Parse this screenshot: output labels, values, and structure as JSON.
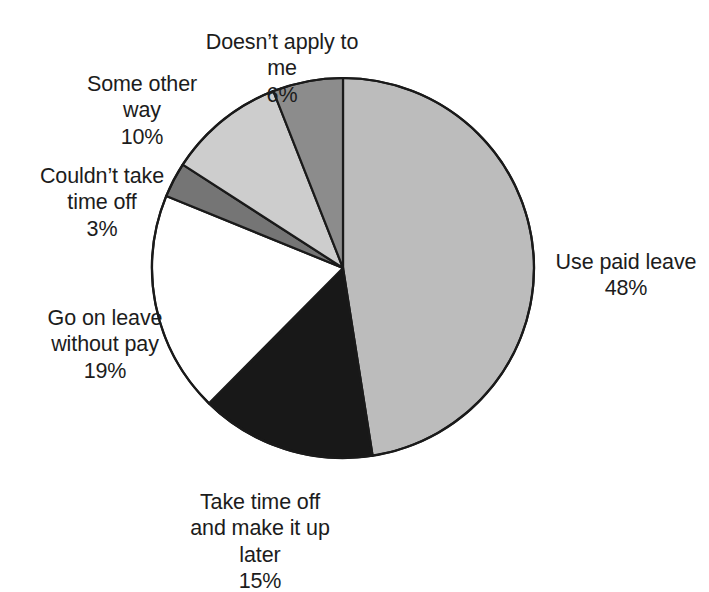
{
  "chart_data": {
    "type": "pie",
    "title": "",
    "subtitle": "",
    "xlabel": "",
    "ylabel": "",
    "legend_position": "outside-labels",
    "grid": false,
    "start_angle_deg": 90,
    "direction": "clockwise",
    "unit": "%",
    "categories": [
      "Use paid leave",
      "Take time off and make it up later",
      "Go on leave without pay",
      "Couldn't take time off",
      "Some other way",
      "Doesn't apply to me"
    ],
    "values": [
      48,
      15,
      19,
      3,
      10,
      6
    ],
    "slices": [
      {
        "name": "use-paid-leave",
        "label": "Use paid leave",
        "label_lines": "Use paid leave",
        "value": 48,
        "value_text": "48%",
        "color": "#bcbcbc"
      },
      {
        "name": "take-time-off-make-up",
        "label": "Take time off and make it up later",
        "label_lines": "Take time off\nand make it up\nlater",
        "value": 15,
        "value_text": "15%",
        "color": "#181818"
      },
      {
        "name": "go-on-leave-without-pay",
        "label": "Go on leave without pay",
        "label_lines": "Go on leave\nwithout pay",
        "value": 19,
        "value_text": "19%",
        "color": "#ffffff"
      },
      {
        "name": "couldnt-take-time-off",
        "label": "Couldn't take time off",
        "label_lines": "Couldn’t take\ntime off",
        "value": 3,
        "value_text": "3%",
        "color": "#757575"
      },
      {
        "name": "some-other-way",
        "label": "Some other way",
        "label_lines": "Some other\nway",
        "value": 10,
        "value_text": "10%",
        "color": "#cdcdcd"
      },
      {
        "name": "doesnt-apply-to-me",
        "label": "Doesn't apply to me",
        "label_lines": "Doesn’t apply to\nme",
        "value": 6,
        "value_text": "6%",
        "color": "#8c8c8c"
      }
    ],
    "geometry": {
      "center_x": 343,
      "center_y": 268,
      "radius_x": 191,
      "radius_y": 190,
      "stroke_color": "#1a1a1a",
      "stroke_width": 2.2
    }
  }
}
